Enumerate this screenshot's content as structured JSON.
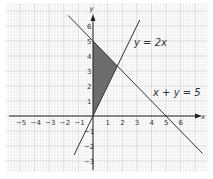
{
  "chart_data": {
    "type": "line",
    "title": "",
    "xlabel": "x",
    "ylabel": "y",
    "xlim": [
      -5.8,
      7.5
    ],
    "ylim": [
      -3.8,
      7.5
    ],
    "x_ticks": [
      "-5",
      "-4",
      "-3",
      "-2",
      "-1",
      "1",
      "2",
      "3",
      "4",
      "5",
      "6"
    ],
    "y_ticks": [
      "-3",
      "-2",
      "-1",
      "1",
      "2",
      "3",
      "4",
      "5",
      "6"
    ],
    "grid": true,
    "series": [
      {
        "name": "y = 2x",
        "label": "y = 2x",
        "x": [
          -1.3,
          3.2
        ],
        "y": [
          -2.6,
          6.4
        ]
      },
      {
        "name": "x + y = 5",
        "label": "x + y = 5",
        "x": [
          -1.7,
          7.5
        ],
        "y": [
          6.7,
          -2.5
        ]
      }
    ],
    "shaded_region": {
      "description": "Triangle bounded by x = 0, y = 2x and x + y = 5",
      "vertices": [
        [
          0,
          0
        ],
        [
          0,
          5
        ],
        [
          1.67,
          3.33
        ]
      ],
      "color": "#6d6d6d"
    }
  },
  "labels": {
    "x_axis": "x",
    "y_axis": "y",
    "line1": "y = 2x",
    "line2": "x + y = 5"
  }
}
